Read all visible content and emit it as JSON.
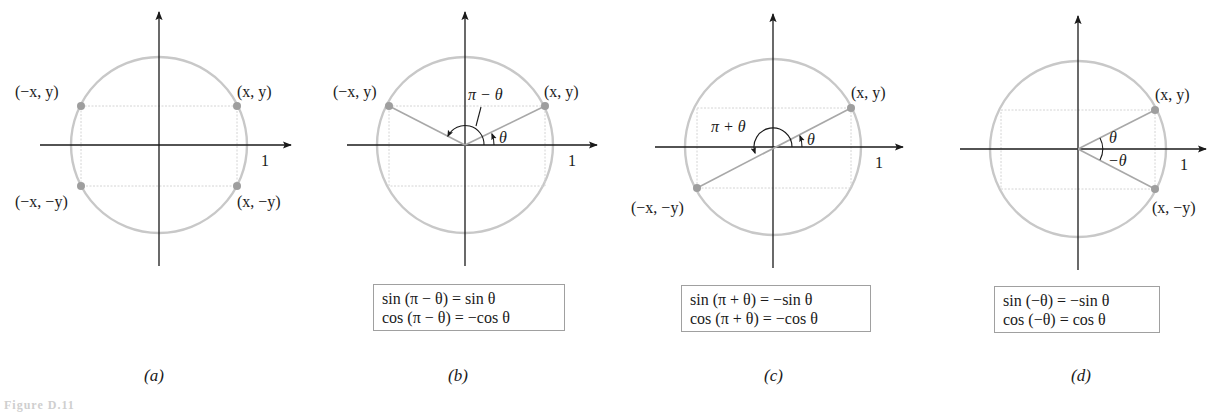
{
  "figure": {
    "caption_partial": "Figure D.11",
    "axis_unit_label": "1",
    "colors": {
      "circle": "#c8c8c8",
      "axis": "#1a1a1a",
      "points": "#9e9e9e",
      "guides": "#d4d4d4"
    }
  },
  "panels": [
    {
      "id": "a",
      "label": "(a)",
      "points": {
        "q1": "(x, y)",
        "q2": "(−x, y)",
        "q3": "(−x, −y)",
        "q4": "(x, −y)"
      },
      "identities": []
    },
    {
      "id": "b",
      "label": "(b)",
      "points": {
        "q1": "(x, y)",
        "q2": "(−x, y)"
      },
      "angles": {
        "theta": "θ",
        "supplement": "π − θ"
      },
      "identities": [
        "sin (π − θ) = sin θ",
        "cos (π − θ) = −cos θ"
      ]
    },
    {
      "id": "c",
      "label": "(c)",
      "points": {
        "q1": "(x, y)",
        "q3": "(−x, −y)"
      },
      "angles": {
        "theta": "θ",
        "sum": "π + θ"
      },
      "identities": [
        "sin (π + θ) = −sin θ",
        "cos (π + θ) = −cos θ"
      ]
    },
    {
      "id": "d",
      "label": "(d)",
      "points": {
        "q1": "(x, y)",
        "q4": "(x, −y)"
      },
      "angles": {
        "theta": "θ",
        "neg_theta": "−θ"
      },
      "identities": [
        "sin (−θ) = −sin θ",
        "cos (−θ) = cos θ"
      ]
    }
  ]
}
